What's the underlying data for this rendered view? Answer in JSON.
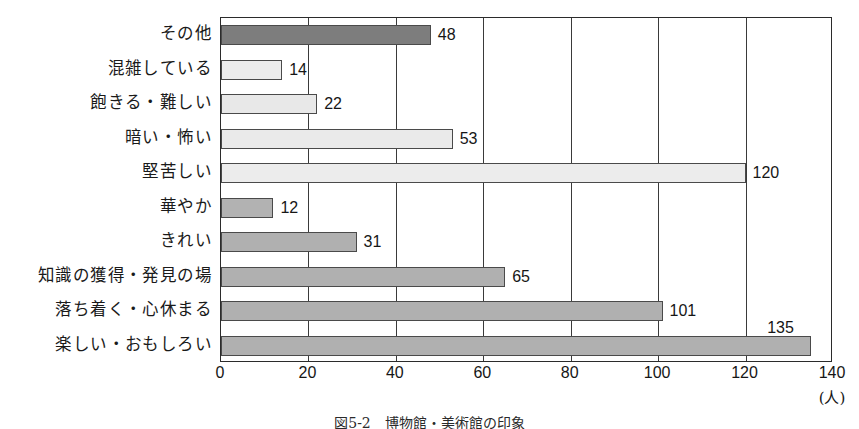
{
  "caption": "図5-2　博物館・美術館の印象",
  "axis_unit": "(人)",
  "chart_data": {
    "type": "bar",
    "orientation": "horizontal",
    "title": "図5-2　博物館・美術館の印象",
    "xlabel": "(人)",
    "ylabel": "",
    "xlim": [
      0,
      140
    ],
    "xticks": [
      0,
      20,
      40,
      60,
      80,
      100,
      120,
      140
    ],
    "xtick_labels": [
      "0",
      "20",
      "40",
      "60",
      "80",
      "100",
      "120",
      "140"
    ],
    "grid": true,
    "legend": "none",
    "categories": [
      "その他",
      "混雑している",
      "飽きる・難しい",
      "暗い・怖い",
      "堅苦しい",
      "華やか",
      "きれい",
      "知識の獲得・発見の場",
      "落ち着く・心休まる",
      "楽しい・おもしろい"
    ],
    "values": [
      48,
      14,
      22,
      53,
      120,
      12,
      31,
      65,
      101,
      135
    ],
    "value_labels": [
      "48",
      "14",
      "22",
      "53",
      "120",
      "12",
      "31",
      "65",
      "101",
      "135"
    ],
    "bar_colors": [
      "#7d7d7d",
      "#ededed",
      "#e8e8e8",
      "#eaeaea",
      "#ececec",
      "#b2b2b2",
      "#b0b0b0",
      "#b0b0b0",
      "#b0b0b0",
      "#b0b0b0"
    ],
    "bar_border_color": "#4a4a4a",
    "axis_color": "#2b2b2b",
    "grid_color": "#3a3a3a",
    "background": "#ffffff"
  }
}
